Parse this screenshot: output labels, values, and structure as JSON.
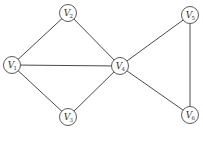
{
  "diagram": {
    "type": "undirected-graph",
    "colors": {
      "edge": "#4a4a4a",
      "node_stroke": "#5a5a5a",
      "node_fill": "#ffffff",
      "label": "#333333"
    },
    "node_radius": 8.5,
    "nodes": [
      {
        "id": "V1",
        "letter": "V",
        "sub": "1",
        "x": 12,
        "y": 65
      },
      {
        "id": "V2",
        "letter": "V",
        "sub": "2",
        "x": 68,
        "y": 13
      },
      {
        "id": "V3",
        "letter": "V",
        "sub": "3",
        "x": 68,
        "y": 117
      },
      {
        "id": "V4",
        "letter": "V",
        "sub": "4",
        "x": 120,
        "y": 66
      },
      {
        "id": "V5",
        "letter": "V",
        "sub": "5",
        "x": 190,
        "y": 15
      },
      {
        "id": "V6",
        "letter": "V",
        "sub": "6",
        "x": 190,
        "y": 115
      }
    ],
    "edges": [
      [
        "V1",
        "V2"
      ],
      [
        "V1",
        "V4"
      ],
      [
        "V1",
        "V3"
      ],
      [
        "V2",
        "V4"
      ],
      [
        "V3",
        "V4"
      ],
      [
        "V4",
        "V5"
      ],
      [
        "V4",
        "V6"
      ],
      [
        "V5",
        "V6"
      ]
    ]
  }
}
